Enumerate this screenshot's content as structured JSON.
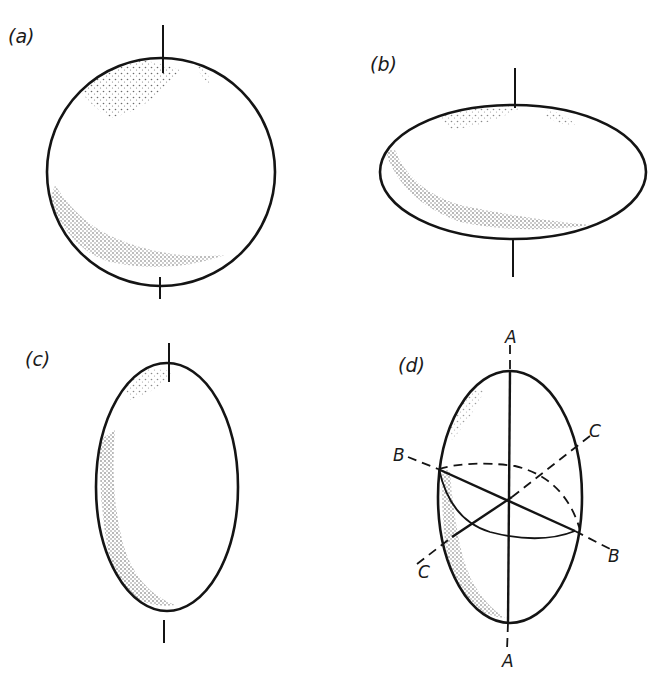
{
  "figure": {
    "panels": [
      {
        "id": "a",
        "label": "(a)",
        "shape": "sphere"
      },
      {
        "id": "b",
        "label": "(b)",
        "shape": "oblate spheroid"
      },
      {
        "id": "c",
        "label": "(c)",
        "shape": "prolate spheroid"
      },
      {
        "id": "d",
        "label": "(d)",
        "shape": "ellipsoid with principal axes",
        "axis_labels": {
          "a_top": "A",
          "a_bottom": "A",
          "b_left": "B",
          "b_right": "B",
          "c_upper": "C",
          "c_lower": "C"
        }
      }
    ],
    "colors": {
      "ink": "#141414",
      "background": "#ffffff"
    }
  }
}
